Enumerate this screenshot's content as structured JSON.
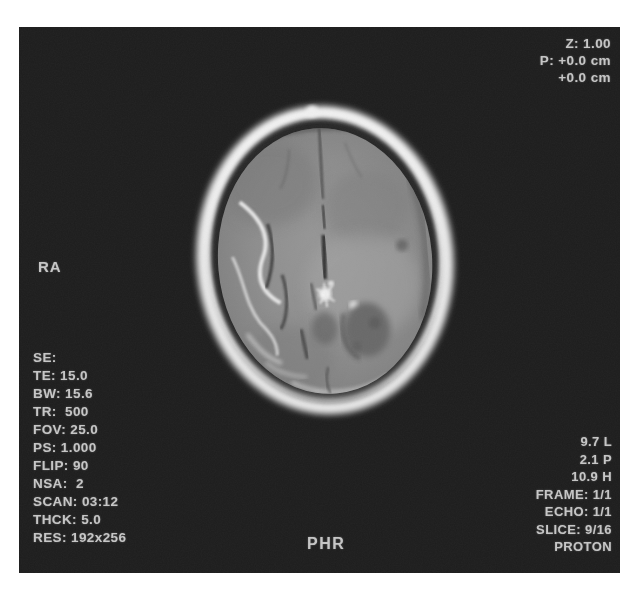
{
  "overlay": {
    "zoom_pan_lines": [
      "Z: 1.00",
      "P: +0.0 cm",
      "+0.0 cm"
    ],
    "orientation_marker": "RA",
    "acquisition_param_lines": [
      "SE:",
      "TE: 15.0",
      "BW: 15.6",
      "TR:  500",
      "FOV: 25.0",
      "PS: 1.000",
      "FLIP: 90",
      "NSA:  2",
      "SCAN: 03:12",
      "THCK: 5.0",
      "RES: 192x256"
    ],
    "position_lines": [
      "9.7 L",
      "2.1 P",
      "10.9 H",
      "FRAME: 1/1",
      "ECHO: 1/1",
      "SLICE: 9/16",
      "PROTON"
    ],
    "patient_label": "PHR"
  },
  "image_content": {
    "description_label": "axial-brain-mri-slice"
  },
  "colors": {
    "page_background": "#ffffff",
    "panel_background": "#1d1d1d",
    "annotation_text": "#c6c6c6",
    "skull_rim": "#ececec",
    "brain_parenchyma": "#8d8d8d"
  }
}
